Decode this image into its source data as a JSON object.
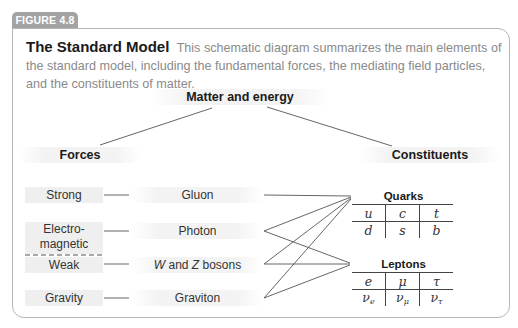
{
  "figure": {
    "tab_label": "FIGURE 4.8",
    "title": "The Standard Model",
    "caption": "This schematic diagram summarizes the main elements of the standard model, including the fundamental forces, the mediating field particles, and the constituents of matter."
  },
  "diagram": {
    "root": "Matter and energy",
    "branches": {
      "forces": "Forces",
      "constituents": "Constituents"
    },
    "forces": [
      {
        "force": "Strong",
        "mediator": "Gluon"
      },
      {
        "force": "Electro-\nmagnetic",
        "force_line1": "Electro-",
        "force_line2": "magnetic",
        "mediator": "Photon"
      },
      {
        "force": "Weak",
        "mediator_italic_W": "W",
        "mediator_and": " and ",
        "mediator_italic_Z": "Z",
        "mediator_tail": " bosons",
        "mediator": "W and Z bosons"
      },
      {
        "force": "Gravity",
        "mediator": "Graviton"
      }
    ],
    "quarks": {
      "label": "Quarks",
      "rows": [
        [
          "u",
          "c",
          "t"
        ],
        [
          "d",
          "s",
          "b"
        ]
      ]
    },
    "leptons": {
      "label": "Leptons",
      "rows": [
        [
          "e",
          "μ",
          "τ"
        ],
        [
          "ν",
          "ν",
          "ν"
        ]
      ],
      "neutrino_subscripts": [
        "e",
        "μ",
        "τ"
      ]
    },
    "connections": [
      {
        "from": "Gluon",
        "to": [
          "Quarks"
        ]
      },
      {
        "from": "Photon",
        "to": [
          "Quarks",
          "Leptons"
        ]
      },
      {
        "from": "W and Z bosons",
        "to": [
          "Quarks",
          "Leptons"
        ]
      },
      {
        "from": "Graviton",
        "to": [
          "Quarks",
          "Leptons"
        ]
      }
    ],
    "note": "dashed line separates Electromagnetic and Weak (electroweak unification)"
  }
}
